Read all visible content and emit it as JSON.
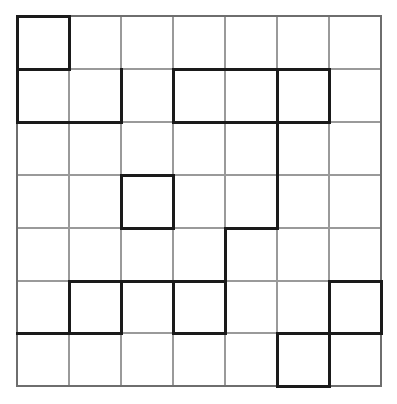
{
  "canvas": {
    "width": 397,
    "height": 404,
    "background": "#ffffff"
  },
  "grid": {
    "name": "puzzle-grid",
    "rows": 7,
    "cols": 7,
    "origin_x": 17,
    "origin_y": 16,
    "cell_size": 52,
    "width": 364,
    "height": 370,
    "row_edges": [
      16,
      69,
      122,
      175,
      228,
      281,
      333,
      386
    ],
    "col_edges": [
      17,
      69,
      121,
      173,
      225,
      277,
      329,
      381
    ],
    "thin_line": {
      "color": "#9a9a9a",
      "width": 1.1
    },
    "thick_line": {
      "color": "#1a1a1a",
      "width": 3.0
    }
  },
  "thick_segments": {
    "horizontal": [
      {
        "row": 0,
        "col_start": 0,
        "col_end": 1
      },
      {
        "row": 1,
        "col_start": 0,
        "col_end": 1
      },
      {
        "row": 1,
        "col_start": 3,
        "col_end": 6
      },
      {
        "row": 2,
        "col_start": 0,
        "col_end": 2
      },
      {
        "row": 2,
        "col_start": 3,
        "col_end": 6
      },
      {
        "row": 3,
        "col_start": 2,
        "col_end": 3
      },
      {
        "row": 4,
        "col_start": 2,
        "col_end": 3
      },
      {
        "row": 4,
        "col_start": 4,
        "col_end": 5
      },
      {
        "row": 5,
        "col_start": 1,
        "col_end": 3
      },
      {
        "row": 5,
        "col_start": 3,
        "col_end": 4
      },
      {
        "row": 5,
        "col_start": 6,
        "col_end": 7
      },
      {
        "row": 6,
        "col_start": 0,
        "col_end": 2
      },
      {
        "row": 6,
        "col_start": 3,
        "col_end": 4
      },
      {
        "row": 6,
        "col_start": 5,
        "col_end": 7
      },
      {
        "row": 7,
        "col_start": 5,
        "col_end": 6
      }
    ],
    "vertical": [
      {
        "col": 0,
        "row_start": 0,
        "row_end": 2
      },
      {
        "col": 1,
        "row_start": 0,
        "row_end": 1
      },
      {
        "col": 2,
        "row_start": 1,
        "row_end": 2
      },
      {
        "col": 2,
        "row_start": 3,
        "row_end": 4
      },
      {
        "col": 3,
        "row_start": 3,
        "row_end": 4
      },
      {
        "col": 3,
        "row_start": 1,
        "row_end": 2
      },
      {
        "col": 6,
        "row_start": 1,
        "row_end": 2
      },
      {
        "col": 5,
        "row_start": 1,
        "row_end": 4
      },
      {
        "col": 4,
        "row_start": 4,
        "row_end": 5
      },
      {
        "col": 1,
        "row_start": 5,
        "row_end": 6
      },
      {
        "col": 2,
        "row_start": 5,
        "row_end": 6
      },
      {
        "col": 3,
        "row_start": 5,
        "row_end": 6
      },
      {
        "col": 4,
        "row_start": 5,
        "row_end": 6
      },
      {
        "col": 6,
        "row_start": 5,
        "row_end": 6
      },
      {
        "col": 7,
        "row_start": 5,
        "row_end": 6
      },
      {
        "col": 5,
        "row_start": 6,
        "row_end": 7
      },
      {
        "col": 6,
        "row_start": 6,
        "row_end": 7
      }
    ]
  },
  "border": {
    "name": "grid-outer-border",
    "color": "#6e6e6e",
    "width": 1.4
  }
}
